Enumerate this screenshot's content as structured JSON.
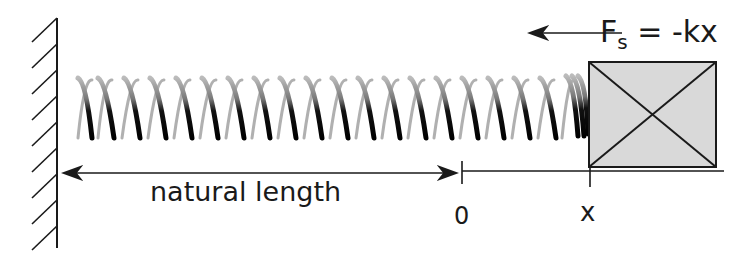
{
  "diagram": {
    "labels": {
      "natural_length": "natural length",
      "origin": "0",
      "displacement": "x",
      "force_symbol": "F",
      "force_subscript": "s",
      "force_equation": " = -kx"
    },
    "elements": {
      "wall": "hatched fixed wall on left",
      "spring": "coiled helical spring attached to wall and block",
      "block": "gray box with diagonal cross",
      "force_arrow": "arrow pointing left",
      "natural_length_arrow": "double-headed arrow from wall to 0",
      "axis": "horizontal line from 0 past x"
    },
    "colors": {
      "line": "#1a1a1a",
      "block_fill": "#d9d9d9",
      "background": "#ffffff"
    }
  }
}
